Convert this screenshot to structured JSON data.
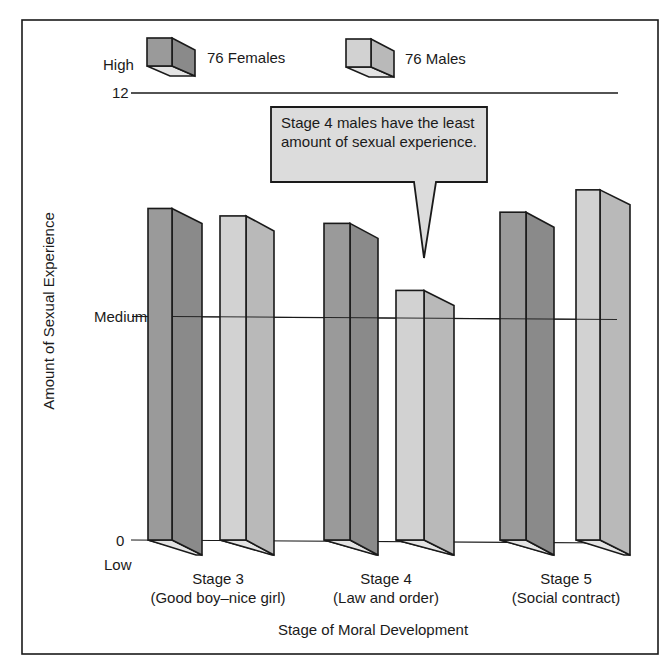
{
  "chart_data": {
    "type": "bar",
    "title": "",
    "xlabel": "Stage of Moral Development",
    "ylabel": "Amount of Sexual Experience",
    "ylim": [
      0,
      12
    ],
    "y_ticks": [
      {
        "value": 12,
        "label": "12",
        "qualitative": "High"
      },
      {
        "value": 6,
        "label": "Medium"
      },
      {
        "value": 0,
        "label": "0",
        "qualitative": "Low"
      }
    ],
    "categories": [
      "Stage 3 (Good boy–nice girl)",
      "Stage 4 (Law and order)",
      "Stage 5 (Social contract)"
    ],
    "series": [
      {
        "name": "76 Females",
        "values": [
          8.9,
          8.5,
          8.8
        ]
      },
      {
        "name": "76 Males",
        "values": [
          8.7,
          6.7,
          9.4
        ]
      }
    ],
    "legend_position": "top",
    "grid": false,
    "annotations": [
      "Stage 4 males have the least amount of sexual experience."
    ],
    "style": "3D bars"
  },
  "legend": {
    "high_label": "High",
    "females_label": "76 Females",
    "males_label": "76 Males"
  },
  "axis": {
    "y_title": "Amount of Sexual Experience",
    "tick_12": "12",
    "tick_medium": "Medium",
    "tick_0": "0",
    "low_label": "Low",
    "x_title": "Stage of Moral Development"
  },
  "categories": [
    {
      "stage": "Stage 3",
      "desc": "(Good boy–nice girl)"
    },
    {
      "stage": "Stage 4",
      "desc": "(Law and order)"
    },
    {
      "stage": "Stage 5",
      "desc": "(Social contract)"
    }
  ],
  "callout": {
    "text": "Stage 4 males have the least amount of sexual experience."
  },
  "colors": {
    "female_front": "#9a9a9a",
    "female_side": "#8a8a8a",
    "male_front": "#d2d2d2",
    "male_side": "#b9b9b9",
    "bottom_face": "#e4e4e4",
    "callout_fill": "#dcdcdc",
    "line": "#1a1a1a"
  }
}
